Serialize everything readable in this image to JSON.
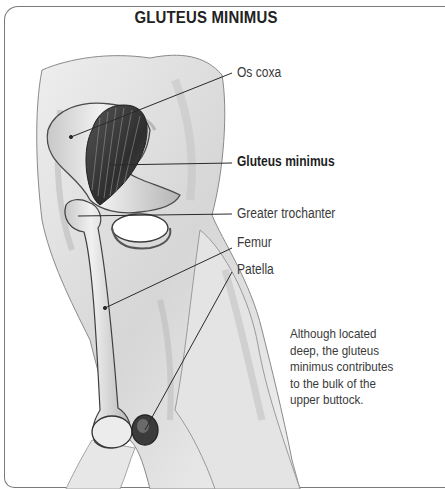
{
  "title": "GLUTEUS MINIMUS",
  "labels": [
    {
      "text": "Os coxa",
      "bold": false
    },
    {
      "text": "Gluteus minimus",
      "bold": true
    },
    {
      "text": "Greater trochanter",
      "bold": false
    },
    {
      "text": "Femur",
      "bold": false
    },
    {
      "text": "Patella",
      "bold": false
    }
  ],
  "description": {
    "lines": [
      "Although located",
      "deep, the gluteus",
      "minimus contributes",
      "to the bulk of the",
      "upper buttock."
    ]
  },
  "illustration": {
    "subject": "posterior-lateral view of hip and thigh showing gluteus minimus muscle",
    "colors": {
      "ink": "#2a2a2a",
      "shade": "#8c8c8c",
      "light_shade": "#c9c9c9",
      "muscle": "#3b3b3b",
      "frame": "#7a7a7a"
    }
  }
}
